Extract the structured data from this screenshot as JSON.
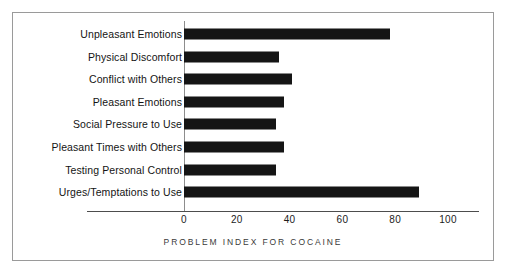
{
  "chart_data": {
    "type": "bar",
    "orientation": "horizontal",
    "title": "",
    "xlabel": "PROBLEM INDEX FOR COCAINE",
    "ylabel": "",
    "xlim": [
      0,
      100
    ],
    "xticks": [
      0,
      20,
      40,
      60,
      80,
      100
    ],
    "xtick_labels": [
      "0",
      "20",
      "40",
      "60",
      "80",
      "100"
    ],
    "grid": false,
    "legend": null,
    "bar_color": "#151515",
    "categories": [
      "Unpleasant Emotions",
      "Physical Discomfort",
      "Conflict with Others",
      "Pleasant Emotions",
      "Social Pressure to Use",
      "Pleasant Times with Others",
      "Testing Personal Control",
      "Urges/Temptations to Use"
    ],
    "values": [
      78,
      36,
      41,
      38,
      35,
      38,
      35,
      89
    ]
  },
  "axis": {
    "x_axis_label": "PROBLEM INDEX FOR COCAINE"
  }
}
